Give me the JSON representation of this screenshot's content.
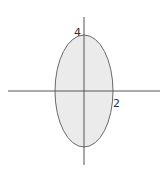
{
  "diagram": {
    "type": "ellipse-on-axes",
    "ellipse": {
      "semi_axis_x": 2,
      "semi_axis_y": 4,
      "fill": "#ebebeb",
      "stroke": "#6a6a6a"
    },
    "axes": {
      "color": "#555555"
    },
    "labels": {
      "y_intercept": "4",
      "x_intercept": "2"
    }
  }
}
